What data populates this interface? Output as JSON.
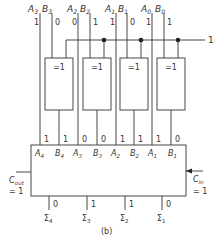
{
  "diagram": {
    "caption": "(b)",
    "control_line_value": "1",
    "inputs": [
      {
        "a_label": "A",
        "a_sub": "3",
        "b_label": "B",
        "b_sub": "3",
        "a_val": "1",
        "b_val": "0"
      },
      {
        "a_label": "A",
        "a_sub": "2",
        "b_label": "B",
        "b_sub": "2",
        "a_val": "0",
        "b_val": "1"
      },
      {
        "a_label": "A",
        "a_sub": "1",
        "b_label": "B",
        "b_sub": "1",
        "a_val": "1",
        "b_val": "0"
      },
      {
        "a_label": "A",
        "a_sub": "0",
        "b_label": "B",
        "b_sub": "0",
        "a_val": "1",
        "b_val": "1"
      }
    ],
    "xor_gates": [
      {
        "label": "=1"
      },
      {
        "label": "=1"
      },
      {
        "label": "=1"
      },
      {
        "label": "=1"
      }
    ],
    "adder_inputs": [
      {
        "label": "A",
        "sub": "4",
        "val": "1"
      },
      {
        "label": "B",
        "sub": "4",
        "val": "1"
      },
      {
        "label": "A",
        "sub": "3",
        "val": "0"
      },
      {
        "label": "B",
        "sub": "3",
        "val": "0"
      },
      {
        "label": "A",
        "sub": "2",
        "val": "1"
      },
      {
        "label": "B",
        "sub": "2",
        "val": "1"
      },
      {
        "label": "A",
        "sub": "1",
        "val": "1"
      },
      {
        "label": "B",
        "sub": "1",
        "val": "0"
      }
    ],
    "carry_out": {
      "label": "C",
      "sub": "out",
      "val": "= 1"
    },
    "carry_in": {
      "label": "C",
      "sub": "in",
      "val": "= 1"
    },
    "outputs": [
      {
        "label": "Σ",
        "sub": "4",
        "val": "0"
      },
      {
        "label": "Σ",
        "sub": "3",
        "val": "1"
      },
      {
        "label": "Σ",
        "sub": "2",
        "val": "1"
      },
      {
        "label": "Σ",
        "sub": "1",
        "val": "0"
      }
    ]
  }
}
